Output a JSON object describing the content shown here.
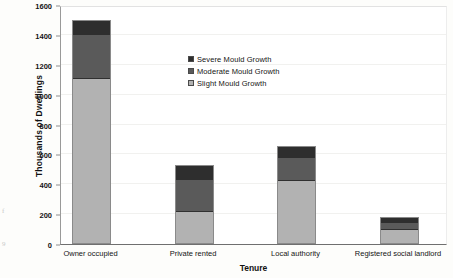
{
  "chart_data": {
    "type": "bar",
    "subtype": "stacked-vertical",
    "title": "",
    "xlabel": "Tenure",
    "ylabel": "Thousands of Dwellings",
    "categories": [
      "Owner occupied",
      "Private rented",
      "Local authority",
      "Registered social landlord"
    ],
    "series": [
      {
        "name": "Slight Mould Growth",
        "color": "#b2b2b2",
        "values": [
          1111,
          223,
          430,
          102
        ]
      },
      {
        "name": "Moderate Mould Growth",
        "color": "#5a5a5a",
        "values": [
          288,
          208,
          147,
          36
        ]
      },
      {
        "name": "Severe Mould Growth",
        "color": "#2e2e2e",
        "values": [
          101,
          100,
          80,
          44
        ]
      }
    ],
    "totals": [
      1500,
      531,
      657,
      182
    ],
    "ylim": [
      0,
      1600
    ],
    "ytick_values": [
      0,
      200,
      400,
      600,
      800,
      1000,
      1200,
      1400,
      1600
    ],
    "ytick_labels": [
      "0",
      "200",
      "400",
      "600",
      "800",
      "1000",
      "1200",
      "1400",
      "1600"
    ],
    "grid": true,
    "grid_axis": "y",
    "legend_position": "inside-upper-right",
    "legend_order": [
      "Severe Mould Growth",
      "Moderate Mould Growth",
      "Slight Mould Growth"
    ]
  },
  "legend": {
    "items": [
      {
        "label": "Severe Mould Growth",
        "color": "#2e2e2e"
      },
      {
        "label": "Moderate Mould Growth",
        "color": "#5a5a5a"
      },
      {
        "label": "Slight Mould Growth",
        "color": "#b2b2b2"
      }
    ]
  },
  "axes": {
    "y": {
      "title": "Thousands of Dwellings"
    },
    "x": {
      "title": "Tenure"
    }
  },
  "artifacts": {
    "mark_top": "f",
    "mark_bottom": "9"
  }
}
